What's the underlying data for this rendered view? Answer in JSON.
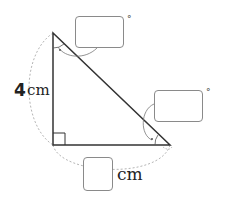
{
  "diagram": {
    "type": "right-triangle",
    "vertices": {
      "top": {
        "x": 53,
        "y": 33
      },
      "right_angle": {
        "x": 53,
        "y": 145
      },
      "right": {
        "x": 170,
        "y": 145
      }
    },
    "vertical_side": {
      "value": "4",
      "unit": "cm"
    },
    "horizontal_side": {
      "value": "",
      "unit": "cm"
    },
    "top_angle": {
      "value": "",
      "unit": "°"
    },
    "right_angle_at_bottom_right_vertex": {
      "value": "",
      "unit": "°"
    },
    "colors": {
      "stroke": "#333333",
      "dashed": "#b0b0b0",
      "box_border": "#8a8a8a"
    }
  }
}
